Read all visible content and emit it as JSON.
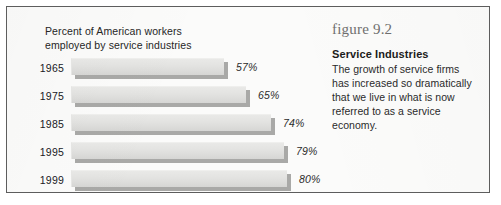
{
  "frame": {
    "border_color": "#5d5d5d",
    "page_background": "#fbfbfa"
  },
  "chart_data": {
    "type": "bar",
    "orientation": "horizontal",
    "title": "Percent  of American workers\nemployed by service industries",
    "xlabel": "",
    "ylabel": "",
    "xlim": [
      0,
      100
    ],
    "grid": false,
    "legend": false,
    "categories": [
      "1965",
      "1975",
      "1985",
      "1995",
      "1999"
    ],
    "values": [
      57,
      65,
      74,
      79,
      80
    ],
    "value_labels": [
      "57%",
      "65%",
      "74%",
      "79%",
      "80%"
    ],
    "bar_face_color": "#e3e3e1",
    "bar_shadow_color": "#a9a9a7"
  },
  "caption": {
    "figure_label": "figure 9.2",
    "heading": "Service Industries",
    "body": "The growth of service firms has increased so dramatically that we live in what is now referred to as a service economy."
  }
}
